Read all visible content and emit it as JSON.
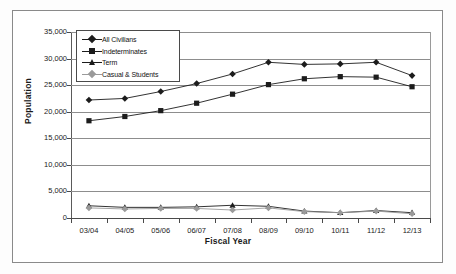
{
  "chart_data": {
    "type": "line",
    "title": "",
    "xlabel": "Fiscal Year",
    "ylabel": "Population",
    "categories": [
      "03/04",
      "04/05",
      "05/06",
      "06/07",
      "07/08",
      "08/09",
      "09/10",
      "10/11",
      "11/12",
      "12/13"
    ],
    "ylim": [
      0,
      35000
    ],
    "yticks": [
      0,
      5000,
      10000,
      15000,
      20000,
      25000,
      30000,
      35000
    ],
    "ytick_labels": [
      "0",
      "5,000",
      "10,000",
      "15,000",
      "20,000",
      "25,000",
      "30,000",
      "35,000"
    ],
    "grid": true,
    "legend_position": "upper-left-inside",
    "series": [
      {
        "name": "All Civilians",
        "marker": "diamond",
        "color": "#1c1c1c",
        "values": [
          22200,
          22500,
          23800,
          25300,
          27100,
          29300,
          28900,
          29000,
          29300,
          26800
        ]
      },
      {
        "name": "Indeterminates",
        "marker": "square",
        "color": "#1c1c1c",
        "values": [
          18300,
          19100,
          20200,
          21600,
          23300,
          25100,
          26200,
          26600,
          26500,
          24700
        ]
      },
      {
        "name": "Term",
        "marker": "triangle",
        "color": "#1c1c1c",
        "values": [
          2300,
          2000,
          2000,
          2100,
          2400,
          2200,
          1300,
          1000,
          1400,
          1000
        ]
      },
      {
        "name": "Casual & Students",
        "marker": "diamond-light",
        "color": "#9a9a9a",
        "values": [
          1900,
          1700,
          1800,
          1800,
          1500,
          1900,
          1200,
          1000,
          1300,
          800
        ]
      }
    ]
  },
  "axes": {
    "y_title": "Population",
    "x_title": "Fiscal Year"
  },
  "legend": {
    "items": [
      {
        "label": "All Civilians"
      },
      {
        "label": "Indeterminates"
      },
      {
        "label": "Term"
      },
      {
        "label": "Casual & Students"
      }
    ]
  }
}
